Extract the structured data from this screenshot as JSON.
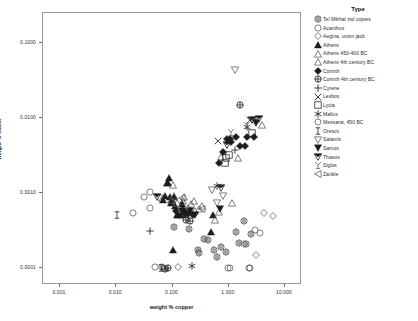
{
  "chart_data": {
    "type": "scatter",
    "title": "",
    "xlabel": "weight % copper",
    "ylabel": "weight % nickel",
    "xscale": "log",
    "yscale": "log",
    "xlim": [
      0.0005,
      20.0
    ],
    "ylim": [
      6e-05,
      0.25
    ],
    "xticks": [
      "0.001",
      "0.010",
      "0.100",
      "1.000",
      "10.000"
    ],
    "xtick_values": [
      0.001,
      0.01,
      0.1,
      1.0,
      10.0
    ],
    "yticks": [
      "0.1000",
      "0.0100",
      "0.0010",
      "0.0001"
    ],
    "ytick_values": [
      0.1,
      0.01,
      0.001,
      0.0001
    ],
    "grid": false,
    "legend_position": "right",
    "legend_title": "Type",
    "series": [
      {
        "name": "Tel Mikhal zwl copies",
        "marker": "star-circle",
        "points": [
          [
            0.28,
            0.000175
          ],
          [
            0.42,
            0.000235
          ],
          [
            0.3,
            0.00016
          ],
          [
            0.55,
            0.000175
          ],
          [
            0.72,
            0.000195
          ],
          [
            0.88,
            0.000165
          ],
          [
            1.35,
            0.0003
          ],
          [
            1.9,
            0.00042
          ],
          [
            2.5,
            0.000285
          ],
          [
            1.55,
            0.000215
          ],
          [
            0.62,
            0.00014
          ],
          [
            0.2,
            0.00033
          ],
          [
            0.105,
            0.00035
          ],
          [
            2.0,
            0.00021
          ],
          [
            0.36,
            0.000245
          ]
        ]
      },
      {
        "name": "Acanthus",
        "marker": "circle-open",
        "points": [
          [
            0.04,
            0.00105
          ],
          [
            0.031,
            0.0009
          ],
          [
            0.04,
            0.00063
          ],
          [
            0.049,
            0.000105
          ],
          [
            0.066,
            0.000103
          ],
          [
            0.95,
            0.0001
          ],
          [
            2.3,
            0.0001
          ],
          [
            0.02,
            0.00055
          ]
        ]
      },
      {
        "name": "Aegina, union jack",
        "marker": "diamond-open",
        "points": [
          [
            0.125,
            0.000105
          ],
          [
            4.3,
            0.00055
          ],
          [
            6.0,
            0.0005
          ],
          [
            1.9,
            0.00021
          ],
          [
            3.0,
            0.00015
          ]
        ]
      },
      {
        "name": "Athens",
        "marker": "triangle-filled",
        "points": [
          [
            0.082,
            0.00135
          ],
          [
            0.074,
            0.00092
          ],
          [
            0.091,
            0.00088
          ],
          [
            0.105,
            0.00088
          ],
          [
            0.098,
            0.00082
          ],
          [
            0.068,
            0.00082
          ],
          [
            0.079,
            0.00135
          ],
          [
            0.086,
            0.0016
          ],
          [
            0.093,
            0.00075
          ],
          [
            0.118,
            0.00052
          ],
          [
            0.128,
            0.00052
          ],
          [
            0.139,
            0.00051
          ],
          [
            0.1,
            0.000175
          ],
          [
            0.145,
            0.00072
          ],
          [
            0.11,
            0.00068
          ],
          [
            0.52,
            0.00052
          ],
          [
            0.49,
            0.0003
          ]
        ]
      },
      {
        "name": "Athens 450-400 BC",
        "marker": "triangle-open",
        "points": [
          [
            0.106,
            0.00092
          ],
          [
            0.16,
            0.0009
          ],
          [
            0.21,
            0.00072
          ],
          [
            0.245,
            0.00078
          ],
          [
            0.29,
            0.00062
          ],
          [
            0.185,
            0.00063
          ],
          [
            0.34,
            0.00068
          ],
          [
            0.1,
            0.0013
          ],
          [
            0.58,
            0.00044
          ],
          [
            1.15,
            0.00073
          ],
          [
            3.9,
            0.008
          ],
          [
            0.68,
            0.00056
          ]
        ]
      },
      {
        "name": "Athens 4th century BC",
        "marker": "triangle-open2",
        "points": [
          [
            0.093,
            0.00082
          ],
          [
            0.122,
            0.00075
          ],
          [
            0.155,
            0.00078
          ],
          [
            0.205,
            0.0006
          ],
          [
            0.25,
            0.00058
          ],
          [
            0.74,
            0.003
          ],
          [
            1.45,
            0.0029
          ]
        ]
      },
      {
        "name": "Corinth",
        "marker": "diamond-filled",
        "points": [
          [
            0.156,
            0.0006
          ],
          [
            0.17,
            0.00057
          ],
          [
            0.116,
            0.00058
          ],
          [
            0.23,
            0.00051
          ],
          [
            0.67,
            0.0025
          ],
          [
            0.78,
            0.0035
          ],
          [
            1.05,
            0.0052
          ],
          [
            1.35,
            0.0056
          ],
          [
            1.95,
            0.0042
          ],
          [
            2.8,
            0.0056
          ],
          [
            2.1,
            0.0056
          ],
          [
            1.1,
            0.0048
          ],
          [
            1.6,
            0.0042
          ],
          [
            0.92,
            0.0053
          ]
        ]
      },
      {
        "name": "Corinth 4th century BC",
        "marker": "circle-plus",
        "points": [
          [
            0.175,
            0.00044
          ],
          [
            0.205,
            0.00042
          ],
          [
            0.075,
            9.9e-05
          ],
          [
            0.082,
            9.95e-05
          ],
          [
            1.6,
            0.015
          ]
        ]
      },
      {
        "name": "Cyrene",
        "marker": "plus",
        "points": [
          [
            1.3,
            0.0038
          ],
          [
            2.9,
            0.0093
          ],
          [
            0.04,
            0.00031
          ]
        ]
      },
      {
        "name": "Lesbos",
        "marker": "cross",
        "points": [
          [
            0.64,
            0.005
          ],
          [
            2.4,
            0.0095
          ]
        ]
      },
      {
        "name": "Lycia",
        "marker": "square-open",
        "points": [
          [
            0.9,
            0.0029
          ],
          [
            1.0,
            0.0032
          ],
          [
            0.85,
            0.0025
          ],
          [
            2.6,
            0.0064
          ]
        ]
      },
      {
        "name": "Mallus",
        "marker": "star6",
        "points": [
          [
            0.62,
            0.00125
          ],
          [
            2.1,
            0.0076
          ],
          [
            0.225,
            0.000108
          ]
        ]
      },
      {
        "name": "Messana, 450 BC",
        "marker": "circle-open2",
        "points": [
          [
            0.072,
            0.000102
          ],
          [
            1.05,
            0.0001
          ],
          [
            2.4,
            0.0001
          ],
          [
            2.9,
            0.00032
          ],
          [
            3.6,
            0.000295
          ]
        ]
      },
      {
        "name": "Orescii",
        "marker": "ibeam",
        "points": [
          [
            0.0105,
            0.00052
          ],
          [
            0.15,
            0.00068
          ],
          [
            0.062,
            0.0001
          ]
        ]
      },
      {
        "name": "Salamis",
        "marker": "triangle-down-open",
        "points": [
          [
            0.058,
            0.00085
          ],
          [
            1.3,
            0.043
          ],
          [
            0.8,
            0.00092
          ],
          [
            0.62,
            0.00074
          ],
          [
            0.51,
            0.0011
          ]
        ]
      },
      {
        "name": "Samos",
        "marker": "triangle-down-filled",
        "points": [
          [
            0.145,
            0.00058
          ],
          [
            0.165,
            0.00051
          ],
          [
            0.19,
            0.00052
          ],
          [
            0.208,
            0.00058
          ],
          [
            0.255,
            0.00051
          ],
          [
            0.7,
            0.00061
          ],
          [
            3.0,
            0.0087
          ]
        ]
      },
      {
        "name": "Thasos",
        "marker": "triangle-down-half",
        "points": [
          [
            0.054,
            0.00088
          ],
          [
            0.74,
            0.00118
          ],
          [
            0.94,
            0.0044
          ],
          [
            2.6,
            0.0093
          ],
          [
            3.4,
            0.0098
          ]
        ]
      },
      {
        "name": "Siglos",
        "marker": "sigloi",
        "points": [
          [
            1.1,
            0.0066
          ],
          [
            2.1,
            0.008
          ],
          [
            0.105,
            0.00082
          ]
        ]
      },
      {
        "name": "Zankle",
        "marker": "triangle-left-open",
        "points": [
          [
            0.15,
            0.00086
          ],
          [
            0.33,
            0.00062
          ]
        ]
      }
    ]
  }
}
